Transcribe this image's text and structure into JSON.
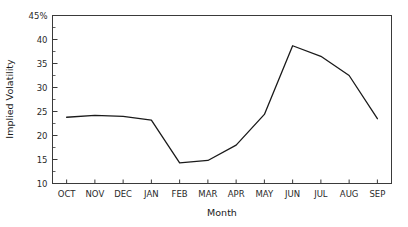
{
  "chart_data": {
    "type": "line",
    "title": "",
    "xlabel": "Month",
    "ylabel": "Implied Volatility",
    "categories": [
      "OCT",
      "NOV",
      "DEC",
      "JAN",
      "FEB",
      "MAR",
      "APR",
      "MAY",
      "JUN",
      "JUL",
      "AUG",
      "SEP"
    ],
    "values": [
      23.8,
      24.2,
      24.0,
      23.2,
      14.3,
      14.8,
      18.0,
      24.4,
      38.7,
      36.5,
      32.5,
      23.5
    ],
    "series": [
      {
        "name": "Implied Volatility",
        "values": [
          23.8,
          24.2,
          24.0,
          23.2,
          14.3,
          14.8,
          18.0,
          24.4,
          38.7,
          36.5,
          32.5,
          23.5
        ]
      }
    ],
    "ylim": [
      10,
      45
    ],
    "ytick_labels": [
      "10",
      "15",
      "20",
      "25",
      "30",
      "35",
      "40",
      "45%"
    ],
    "ytick_values": [
      10,
      15,
      20,
      25,
      30,
      35,
      40,
      45
    ],
    "minor_ticks": true,
    "grid": false,
    "legend": false,
    "legend_position": "none",
    "line_color": "#1a1a1a",
    "background_color": "#ffffff",
    "axis_color": "#3a3a3a"
  }
}
